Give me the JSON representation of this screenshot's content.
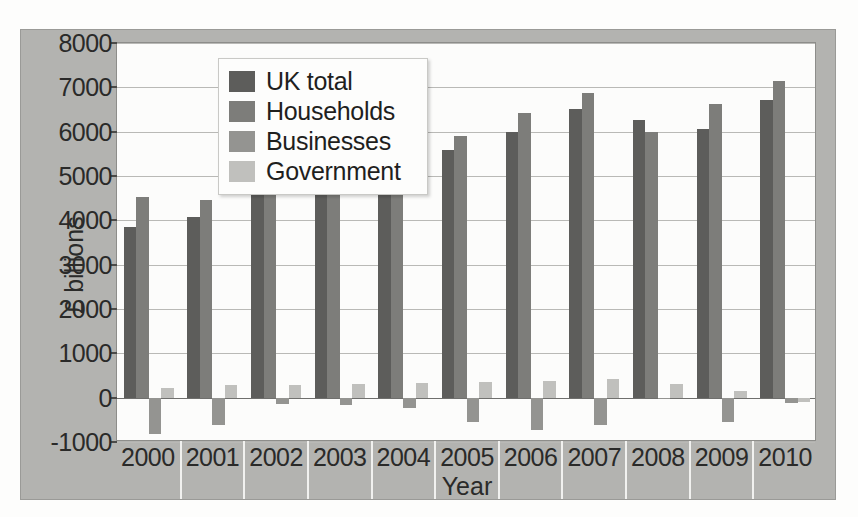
{
  "chart_data": {
    "type": "bar",
    "title": "",
    "xlabel": "Year",
    "ylabel": "£ billions",
    "categories": [
      "2000",
      "2001",
      "2002",
      "2003",
      "2004",
      "2005",
      "2006",
      "2007",
      "2008",
      "2009",
      "2010"
    ],
    "ylim": [
      -1000,
      8000
    ],
    "yticks": [
      8000,
      7000,
      6000,
      5000,
      4000,
      3000,
      2000,
      1000,
      0,
      -1000
    ],
    "ytick_labels": [
      "8000",
      "7000",
      "6000",
      "5000",
      "4000",
      "3000",
      "2000",
      "1000",
      "0",
      "-1000"
    ],
    "grid": true,
    "legend_position": "top-left",
    "series": [
      {
        "name": "UK total",
        "color": "#5d5d5b",
        "values": [
          3860,
          4070,
          4650,
          5000,
          5420,
          5580,
          6000,
          6520,
          6270,
          6050,
          6710
        ]
      },
      {
        "name": "Households",
        "color": "#7d7d7a",
        "values": [
          4520,
          4450,
          4570,
          4960,
          5410,
          5900,
          6420,
          6870,
          5990,
          6630,
          7150
        ]
      },
      {
        "name": "Businesses",
        "color": "#949491",
        "values": [
          -830,
          -610,
          -140,
          -170,
          -240,
          -540,
          -730,
          -620,
          -40,
          -550,
          -130
        ]
      },
      {
        "name": "Government",
        "color": "#c0c0bd",
        "values": [
          220,
          280,
          290,
          300,
          320,
          350,
          380,
          420,
          310,
          150,
          -100
        ]
      }
    ]
  },
  "legend": {
    "items": [
      {
        "label": "UK total"
      },
      {
        "label": "Households"
      },
      {
        "label": "Businesses"
      },
      {
        "label": "Government"
      }
    ]
  }
}
